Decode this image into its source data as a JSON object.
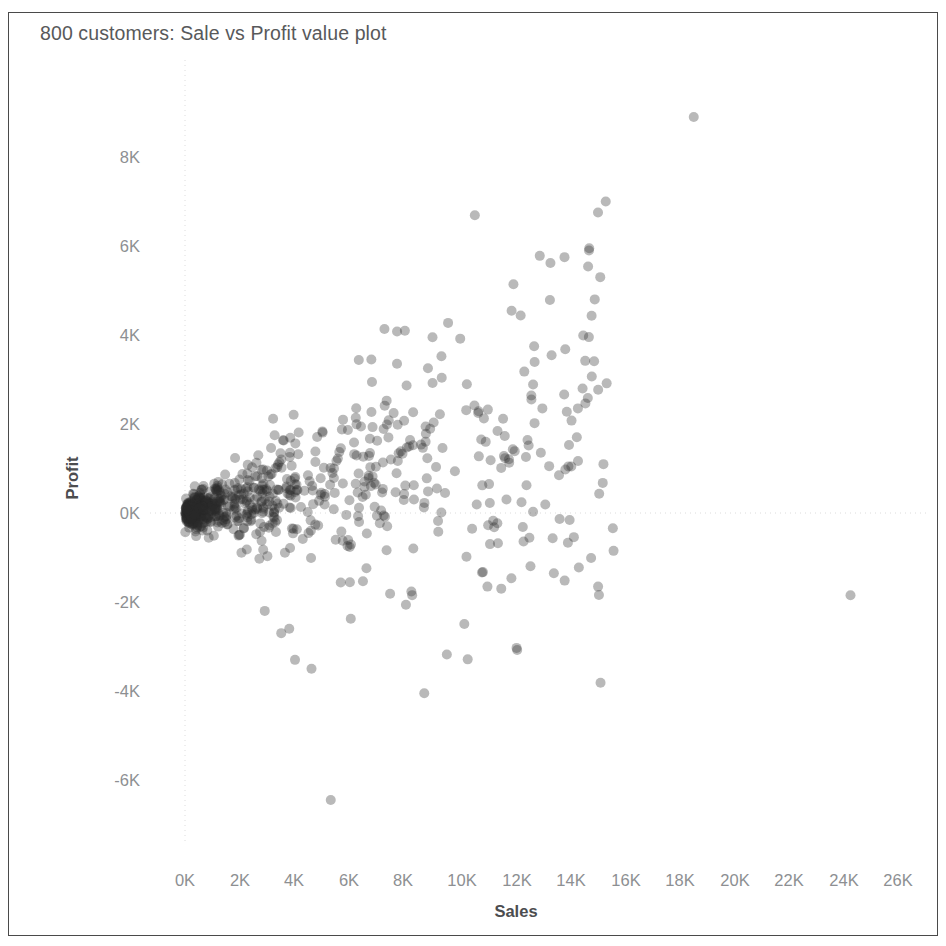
{
  "chart_data": {
    "type": "scatter",
    "title": "800 customers: Sale vs Profit value plot",
    "xlabel": "Sales",
    "ylabel": "Profit",
    "grid": true,
    "legend": false,
    "xlim": [
      -700,
      27200
    ],
    "ylim": [
      -7000,
      9600
    ],
    "xtick_labels": [
      "0K",
      "2K",
      "4K",
      "6K",
      "8K",
      "10K",
      "12K",
      "14K",
      "16K",
      "18K",
      "20K",
      "22K",
      "24K",
      "26K"
    ],
    "xtick_values": [
      0,
      2000,
      4000,
      6000,
      8000,
      10000,
      12000,
      14000,
      16000,
      18000,
      20000,
      22000,
      24000,
      26000
    ],
    "ytick_labels": [
      "8K",
      "6K",
      "4K",
      "2K",
      "0K",
      "-2K",
      "-4K",
      "-6K"
    ],
    "ytick_values": [
      8000,
      6000,
      4000,
      2000,
      0,
      -2000,
      -4000,
      -6000
    ],
    "marker": {
      "shape": "circle",
      "diameter_px": 10,
      "color": "#2b2b2b",
      "opacity": 0.33
    },
    "n_points_label": 800,
    "notable_points": [
      {
        "x": 18500,
        "y": 8900
      },
      {
        "x": 15300,
        "y": 7000
      },
      {
        "x": 13800,
        "y": 5750
      },
      {
        "x": 14700,
        "y": 5950
      },
      {
        "x": 15100,
        "y": 5300
      },
      {
        "x": 14900,
        "y": 4800
      },
      {
        "x": 9000,
        "y": 3950
      },
      {
        "x": 24200,
        "y": -1850
      },
      {
        "x": 5300,
        "y": -6450
      },
      {
        "x": 8700,
        "y": -4050
      },
      {
        "x": 4600,
        "y": -3500
      },
      {
        "x": 4000,
        "y": -3300
      },
      {
        "x": 3500,
        "y": -2700
      },
      {
        "x": 2900,
        "y": -2200
      },
      {
        "x": 11500,
        "y": -1700
      },
      {
        "x": 13600,
        "y": 850
      }
    ],
    "series": [
      {
        "name": "customers",
        "description": "Dense cluster of ~800 customer records concentrated near the origin (0-4K sales, around 0K profit), fanning upward and rightward with increasing spread; a sparse tail of high-sales outliers extends to 26K."
      }
    ]
  },
  "axes": {
    "x": {
      "ticks": [
        {
          "label": "0K",
          "px": 185
        },
        {
          "label": "2K",
          "px": 240
        },
        {
          "label": "4K",
          "px": 294
        },
        {
          "label": "6K",
          "px": 349
        },
        {
          "label": "8K",
          "px": 403
        },
        {
          "label": "10K",
          "px": 462
        },
        {
          "label": "12K",
          "px": 517
        },
        {
          "label": "14K",
          "px": 571
        },
        {
          "label": "16K",
          "px": 626
        },
        {
          "label": "18K",
          "px": 680
        },
        {
          "label": "20K",
          "px": 735
        },
        {
          "label": "22K",
          "px": 789
        },
        {
          "label": "24K",
          "px": 844
        },
        {
          "label": "26K",
          "px": 898
        }
      ],
      "label_y_px": 871
    },
    "y": {
      "ticks": [
        {
          "label": "8K",
          "px": 157
        },
        {
          "label": "6K",
          "px": 246
        },
        {
          "label": "4K",
          "px": 335
        },
        {
          "label": "2K",
          "px": 424
        },
        {
          "label": "0K",
          "px": 513
        },
        {
          "label": "-2K",
          "px": 602
        },
        {
          "label": "-4K",
          "px": 691
        },
        {
          "label": "-6K",
          "px": 780
        }
      ],
      "label_right_px": 140
    }
  }
}
